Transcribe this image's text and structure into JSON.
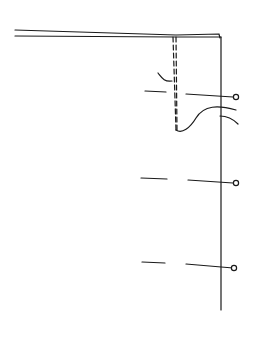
{
  "diagram": {
    "type": "line-drawing",
    "stroke_color": "#1a1a1a",
    "background": "#ffffff",
    "markers": [
      {
        "id": "pin-1",
        "y": 97
      },
      {
        "id": "pin-2",
        "y": 183
      },
      {
        "id": "pin-3",
        "y": 268
      }
    ]
  }
}
